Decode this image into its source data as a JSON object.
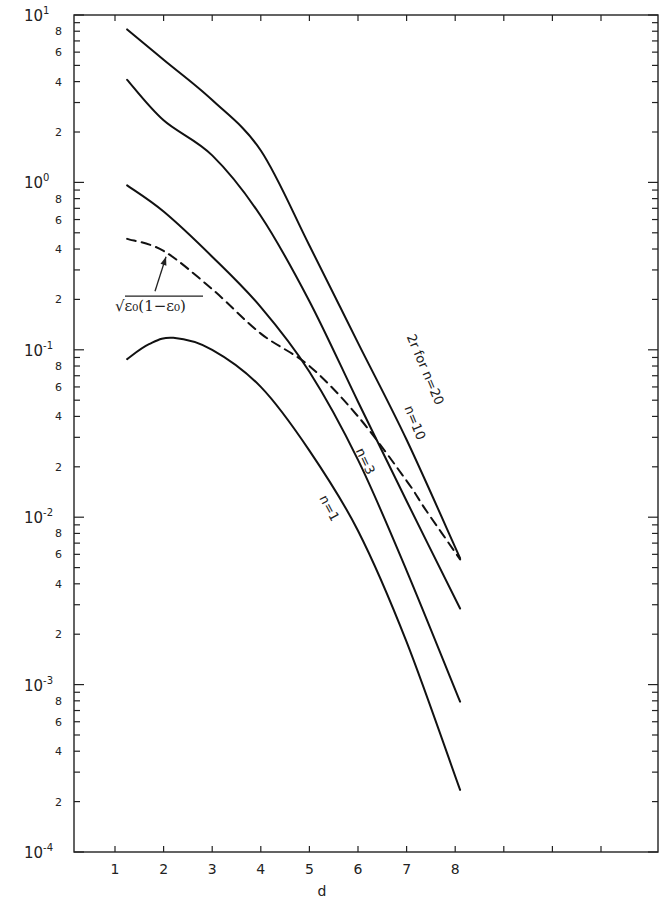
{
  "chart_data": {
    "type": "line",
    "title": "",
    "xlabel": "d",
    "ylabel": "",
    "xscale": "linear",
    "yscale": "log",
    "xlim": [
      0,
      11
    ],
    "ylim": [
      0.0001,
      10
    ],
    "grid": false,
    "x_ticks": [
      {
        "value": 1,
        "label": "1"
      },
      {
        "value": 2,
        "label": "2"
      },
      {
        "value": 3,
        "label": "3"
      },
      {
        "value": 4,
        "label": "4"
      },
      {
        "value": 5,
        "label": "5"
      },
      {
        "value": 6,
        "label": "6"
      },
      {
        "value": 7,
        "label": "7"
      },
      {
        "value": 8,
        "label": "8"
      },
      {
        "value": 9,
        "label": ""
      },
      {
        "value": 10,
        "label": ""
      },
      {
        "value": 11,
        "label": ""
      }
    ],
    "y_decades": [
      {
        "exp": 1,
        "base": "10",
        "sup": "1"
      },
      {
        "exp": 0,
        "base": "10",
        "sup": "0"
      },
      {
        "exp": -1,
        "base": "10",
        "sup": "-1"
      },
      {
        "exp": -2,
        "base": "10",
        "sup": "-2"
      },
      {
        "exp": -3,
        "base": "10",
        "sup": "-3"
      },
      {
        "exp": -4,
        "base": "10",
        "sup": "-4"
      }
    ],
    "y_minor_labels": [
      "2",
      "4",
      "6",
      "8"
    ],
    "series": [
      {
        "name": "2r for n=20",
        "style": "solid",
        "x": [
          1.25,
          2,
          3,
          4,
          5,
          6,
          7,
          8.1
        ],
        "values": [
          8.2,
          5.4,
          3.1,
          1.55,
          0.42,
          0.11,
          0.029,
          0.0057
        ]
      },
      {
        "name": "n=10",
        "style": "solid",
        "x": [
          1.25,
          2,
          3,
          4,
          5,
          6,
          7,
          8.1
        ],
        "values": [
          4.1,
          2.35,
          1.45,
          0.63,
          0.195,
          0.049,
          0.0125,
          0.00285
        ]
      },
      {
        "name": "n=3",
        "style": "solid",
        "x": [
          1.25,
          2,
          3,
          4,
          5,
          6,
          7,
          8.1
        ],
        "values": [
          0.96,
          0.67,
          0.36,
          0.18,
          0.074,
          0.022,
          0.0048,
          0.00079
        ]
      },
      {
        "name": "n=1",
        "style": "solid",
        "x": [
          1.25,
          1.7,
          2.2,
          3,
          4,
          5,
          6,
          7,
          8.1
        ],
        "values": [
          0.088,
          0.108,
          0.118,
          0.1,
          0.06,
          0.025,
          0.0083,
          0.0018,
          0.000235
        ]
      },
      {
        "name": "√ε₀(1−ε₀)",
        "style": "dashed",
        "x": [
          1.25,
          2,
          3,
          4,
          5,
          6,
          7,
          7.4,
          8.1
        ],
        "values": [
          0.46,
          0.39,
          0.23,
          0.125,
          0.08,
          0.04,
          0.0165,
          0.011,
          0.0056
        ]
      }
    ],
    "annotations": [
      {
        "text": "2r for n=20",
        "series": "2r for n=20",
        "x": 7.0,
        "y": 0.12,
        "rotation": 67
      },
      {
        "text": "n=10",
        "series": "n=10",
        "x": 6.95,
        "y": 0.045,
        "rotation": 68
      },
      {
        "text": "n=3",
        "series": "n=3",
        "x": 5.95,
        "y": 0.025,
        "rotation": 65
      },
      {
        "text": "n=1",
        "series": "n=1",
        "x": 5.2,
        "y": 0.013,
        "rotation": 62
      },
      {
        "text": "√ε₀(1−ε₀)",
        "series": "√ε₀(1−ε₀)",
        "x": 1.0,
        "y": 0.17,
        "rotation": 0,
        "arrow_to": {
          "x": 2.05,
          "y": 0.38
        }
      }
    ]
  }
}
